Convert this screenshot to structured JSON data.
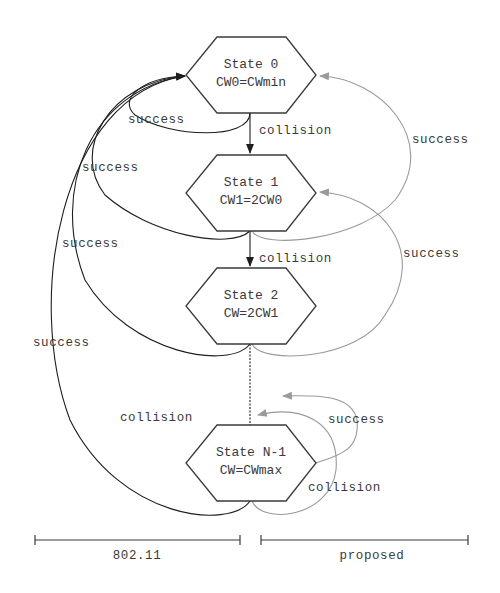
{
  "diagram": {
    "type": "state-transition",
    "states": [
      {
        "id": "s0",
        "name": "State 0",
        "cw": "CW0=CWmin"
      },
      {
        "id": "s1",
        "name": "State 1",
        "cw": "CW1=2CW0"
      },
      {
        "id": "s2",
        "name": "State 2",
        "cw": "CW=2CW1"
      },
      {
        "id": "sn",
        "name": "State N-1",
        "cw": "CW=CWmax"
      }
    ],
    "labels": {
      "success_left_0": "success",
      "success_left_1": "success",
      "success_left_2": "success",
      "success_left_3": "success",
      "collision_0_1": "collision",
      "collision_1_2": "collision",
      "collision_left_n": "collision",
      "success_right_0": "success",
      "success_right_1": "success",
      "success_right_n": "success",
      "collision_right_n": "collision"
    },
    "edges": [
      {
        "from": "State 0",
        "to": "State 1",
        "label": "collision",
        "scheme": "both"
      },
      {
        "from": "State 1",
        "to": "State 2",
        "label": "collision",
        "scheme": "both"
      },
      {
        "from": "State 2",
        "to": "State N-1",
        "label": "collision",
        "scheme": "both"
      },
      {
        "from": "State N-1",
        "to": "State N-1",
        "label": "collision",
        "scheme": "802.11"
      },
      {
        "from": "State 0",
        "to": "State 0",
        "label": "success",
        "scheme": "802.11"
      },
      {
        "from": "State 1",
        "to": "State 0",
        "label": "success",
        "scheme": "802.11"
      },
      {
        "from": "State 2",
        "to": "State 0",
        "label": "success",
        "scheme": "802.11"
      },
      {
        "from": "State N-1",
        "to": "State 0",
        "label": "success",
        "scheme": "802.11"
      },
      {
        "from": "State 1",
        "to": "State 0",
        "label": "success",
        "scheme": "proposed"
      },
      {
        "from": "State 2",
        "to": "State 1",
        "label": "success",
        "scheme": "proposed"
      },
      {
        "from": "State N-1",
        "to": "State N-2",
        "label": "success",
        "scheme": "proposed"
      },
      {
        "from": "State N-1",
        "to": "State N-1",
        "label": "collision",
        "scheme": "proposed"
      }
    ],
    "legend": {
      "left": "802.11",
      "right": "proposed"
    },
    "colors": {
      "ieee80211_edges": "#1e1e1e",
      "proposed_edges": "#9a9a9a",
      "text": "#3a3a3a"
    }
  }
}
